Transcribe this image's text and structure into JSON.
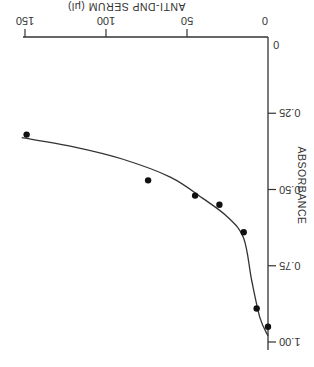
{
  "chart_data": {
    "type": "scatter",
    "title": "",
    "xlabel": "ANTI-DNP SERUM (μl)",
    "ylabel": "ABSORBANCE",
    "orientation_note_visible": "figure rendered rotated 180 degrees",
    "x_ticks": [
      "0",
      "50",
      "100",
      "150"
    ],
    "y_ticks": [
      "0",
      "0.25",
      "0.50",
      "0.75",
      "1.00"
    ],
    "xlim": [
      0,
      150
    ],
    "ylim": [
      0,
      1.0
    ],
    "grid": false,
    "legend": null,
    "series": [
      {
        "name": "measured",
        "marker": "filled-circle",
        "points": [
          {
            "x": 0,
            "y": 0.95
          },
          {
            "x": 7,
            "y": 0.89
          },
          {
            "x": 15,
            "y": 0.64
          },
          {
            "x": 30,
            "y": 0.55
          },
          {
            "x": 45,
            "y": 0.52
          },
          {
            "x": 74,
            "y": 0.47
          },
          {
            "x": 149,
            "y": 0.32
          }
        ]
      },
      {
        "name": "fitted curve",
        "type": "line",
        "points": [
          {
            "x": 0,
            "y": 0.98
          },
          {
            "x": 5,
            "y": 0.92
          },
          {
            "x": 10,
            "y": 0.8
          },
          {
            "x": 15,
            "y": 0.66
          },
          {
            "x": 25,
            "y": 0.59
          },
          {
            "x": 40,
            "y": 0.53
          },
          {
            "x": 60,
            "y": 0.46
          },
          {
            "x": 90,
            "y": 0.4
          },
          {
            "x": 120,
            "y": 0.36
          },
          {
            "x": 152,
            "y": 0.33
          }
        ]
      }
    ]
  }
}
